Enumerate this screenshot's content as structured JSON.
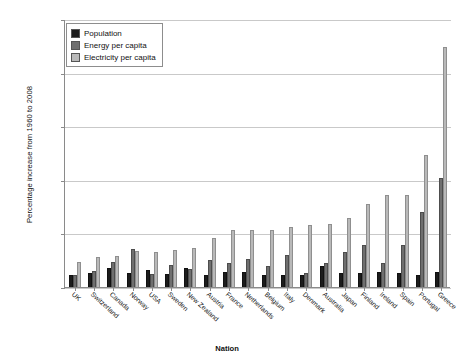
{
  "chart_data": {
    "type": "bar",
    "title": "",
    "xlabel": "Nation",
    "ylabel": "Percentage increase from 1960 to 2008",
    "ylim": [
      0,
      2500
    ],
    "yticks": [
      0,
      500,
      1000,
      1500,
      2000,
      2500
    ],
    "ytick_labels": [
      "0",
      "500",
      "1,000",
      "1,500",
      "2,000",
      "2,500"
    ],
    "grid": true,
    "legend_position": "top-left",
    "categories": [
      "UK",
      "Switzerland",
      "Canada",
      "Norway",
      "USA",
      "Sweden",
      "New Zealand",
      "Austria",
      "France",
      "Netherlands",
      "Belgium",
      "Italy",
      "Denmark",
      "Australia",
      "Japan",
      "Finland",
      "Ireland",
      "Spain",
      "Portugal",
      "Greece"
    ],
    "series": [
      {
        "name": "Population",
        "color": "#1c1c1c",
        "values": [
          114,
          133,
          175,
          132,
          160,
          121,
          182,
          116,
          138,
          139,
          112,
          114,
          113,
          197,
          127,
          130,
          141,
          128,
          113,
          139
        ]
      },
      {
        "name": "Energy per capita",
        "color": "#6f6f6f",
        "values": [
          112,
          148,
          235,
          352,
          122,
          205,
          172,
          253,
          221,
          262,
          194,
          296,
          131,
          226,
          331,
          395,
          227,
          392,
          700,
          1020
        ]
      },
      {
        "name": "Electricity per capita",
        "color": "#b9b9b9",
        "values": [
          232,
          279,
          288,
          333,
          323,
          343,
          360,
          455,
          532,
          532,
          535,
          560,
          577,
          590,
          640,
          770,
          860,
          862,
          1230,
          2240
        ]
      }
    ]
  },
  "legend": {
    "items": [
      {
        "label": "Population",
        "swatch": "population-swatch"
      },
      {
        "label": "Energy per capita",
        "swatch": "energy-swatch"
      },
      {
        "label": "Electricity per capita",
        "swatch": "electricity-swatch"
      }
    ]
  }
}
